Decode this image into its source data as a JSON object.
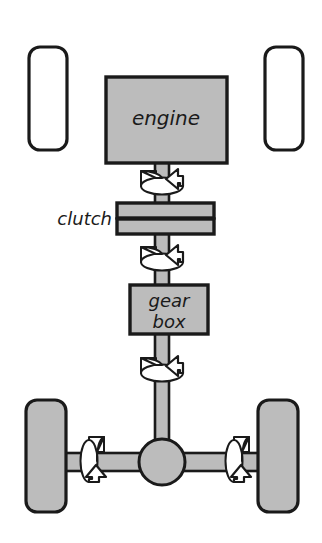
{
  "diagram": {
    "background_color": "#ffffff",
    "outline_color": "#1a1a1a",
    "part_fill_color": "#bcbcbc",
    "arrow_fill_color": "#ffffff",
    "width": 322,
    "height": 543
  },
  "labels": {
    "engine": "engine",
    "clutch": "clutch",
    "gearbox_line1": "gear",
    "gearbox_line2": "box"
  },
  "parts": {
    "wheel_front_left": {
      "name": "front left wheel",
      "fill": "#ffffff",
      "x": 29,
      "y": 47,
      "width": 38,
      "height": 103
    },
    "wheel_front_right": {
      "name": "front right wheel",
      "fill": "#ffffff",
      "x": 265,
      "y": 47,
      "width": 38,
      "height": 103
    },
    "wheel_rear_left": {
      "name": "rear left wheel",
      "fill": "#bcbcbc",
      "x": 26,
      "y": 400,
      "width": 40,
      "height": 112
    },
    "wheel_rear_right": {
      "name": "rear right wheel",
      "fill": "#bcbcbc",
      "x": 258,
      "y": 400,
      "width": 40,
      "height": 112
    },
    "engine_block": {
      "name": "engine",
      "fill": "#bcbcbc",
      "x": 106,
      "y": 77,
      "width": 121,
      "height": 86
    },
    "clutch_plate_top": {
      "name": "clutch upper plate",
      "fill": "#bcbcbc",
      "x": 117,
      "y": 203,
      "width": 97,
      "height": 14
    },
    "clutch_plate_bottom": {
      "name": "clutch lower plate",
      "fill": "#bcbcbc",
      "x": 117,
      "y": 219,
      "width": 97,
      "height": 14
    },
    "gearbox_block": {
      "name": "gear box",
      "fill": "#bcbcbc",
      "x": 130,
      "y": 285,
      "width": 78,
      "height": 49
    },
    "driveshaft": {
      "name": "drive shaft",
      "fill": "#bcbcbc",
      "center_x": 162,
      "thickness": 14,
      "top": 163,
      "bottom": 462
    },
    "rear_axle": {
      "name": "rear axle",
      "fill": "#bcbcbc",
      "center_y": 462,
      "thickness": 18,
      "left": 50,
      "right": 275
    },
    "differential": {
      "name": "differential",
      "fill": "#bcbcbc",
      "center_x": 162,
      "center_y": 462,
      "radius": 23
    }
  },
  "rotation_arrows": [
    {
      "name": "shaft rotation above clutch",
      "axis": "vertical",
      "direction": "counter-clockwise",
      "center_x": 162,
      "center_y": 182
    },
    {
      "name": "shaft rotation below clutch",
      "axis": "vertical",
      "direction": "counter-clockwise",
      "center_x": 162,
      "center_y": 258
    },
    {
      "name": "shaft rotation below gearbox",
      "axis": "vertical",
      "direction": "counter-clockwise",
      "center_x": 162,
      "center_y": 369
    },
    {
      "name": "left axle rotation",
      "axis": "horizontal",
      "direction": "forward",
      "center_x": 98,
      "center_y": 461
    },
    {
      "name": "right axle rotation",
      "axis": "horizontal",
      "direction": "forward",
      "center_x": 243,
      "center_y": 461
    }
  ]
}
